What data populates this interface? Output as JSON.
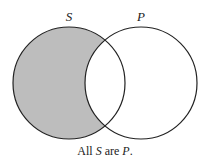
{
  "diagram": {
    "type": "venn",
    "circles": [
      {
        "id": "S",
        "label": "S",
        "cx": 69,
        "cy": 83,
        "r": 56
      },
      {
        "id": "P",
        "label": "P",
        "cx": 141,
        "cy": 83,
        "r": 56
      }
    ],
    "shaded_region": "S minus P",
    "colors": {
      "shade": "#bdbdbd",
      "stroke": "#222222",
      "background": "#ffffff"
    },
    "caption": {
      "part1": "All ",
      "subject": "S",
      "part2": " are ",
      "predicate": "P",
      "part3": "."
    }
  }
}
